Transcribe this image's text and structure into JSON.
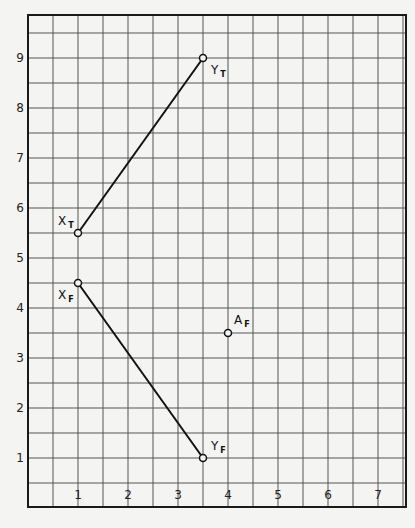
{
  "chart_data": {
    "type": "scatter",
    "title": "",
    "xlabel": "",
    "ylabel": "",
    "xlim": [
      -0.5,
      7.5
    ],
    "ylim": [
      0,
      9.8
    ],
    "grid": true,
    "grid_step": 0.5,
    "x_ticks": [
      "1",
      "2",
      "3",
      "4",
      "5",
      "6",
      "7"
    ],
    "y_ticks": [
      "1",
      "2",
      "3",
      "4",
      "5",
      "6",
      "7",
      "8",
      "9"
    ],
    "points": [
      {
        "name": "XT",
        "label": "X",
        "sub": "T",
        "x": 1,
        "y": 5.5
      },
      {
        "name": "YT",
        "label": "Y",
        "sub": "T",
        "x": 3.5,
        "y": 9
      },
      {
        "name": "XF",
        "label": "X",
        "sub": "F",
        "x": 1,
        "y": 4.5
      },
      {
        "name": "YF",
        "label": "Y",
        "sub": "F",
        "x": 3.5,
        "y": 1
      },
      {
        "name": "AF",
        "label": "A",
        "sub": "F",
        "x": 4,
        "y": 3.5
      }
    ],
    "segments": [
      {
        "from": "XT",
        "to": "YT"
      },
      {
        "from": "XF",
        "to": "YF"
      }
    ]
  }
}
